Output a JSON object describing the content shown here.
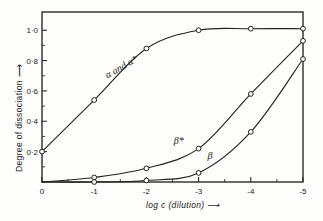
{
  "chart_data": {
    "type": "line",
    "title": "",
    "xlabel": "log c  (dilution)",
    "ylabel": "Degree of dissociation",
    "x": [
      0,
      -1,
      -2,
      -3,
      -4,
      -5
    ],
    "xtick_labels": [
      "0",
      "-1",
      "-2",
      "-3",
      "-4",
      "-5"
    ],
    "ytick_labels": [
      "0·2",
      "0·4",
      "0·6",
      "0·8",
      "1·0"
    ],
    "ytick_values": [
      0.2,
      0.4,
      0.6,
      0.8,
      1.0
    ],
    "xlim": [
      0,
      -5
    ],
    "ylim": [
      0,
      1.12
    ],
    "grid": false,
    "legend_position": "inline-annotations",
    "marker": "open-circle",
    "line_color": "#222222",
    "series": [
      {
        "name": "α and α*",
        "label": "α and α*",
        "values": [
          0.2,
          0.54,
          0.88,
          1.0,
          1.01,
          1.01
        ]
      },
      {
        "name": "β*",
        "label": "β*",
        "values": [
          0.0,
          0.03,
          0.09,
          0.22,
          0.58,
          0.93
        ]
      },
      {
        "name": "β",
        "label": "β",
        "values": [
          0.0,
          0.0,
          0.01,
          0.06,
          0.33,
          0.81
        ]
      }
    ],
    "annotations": [
      {
        "text": "α and α*",
        "x": -1.55,
        "y": 0.74,
        "rotation": -30
      },
      {
        "text": "β*",
        "x": -2.62,
        "y": 0.25,
        "rotation": 0
      },
      {
        "text": "β",
        "x": -3.22,
        "y": 0.15,
        "rotation": 0
      }
    ],
    "axis_arrows": {
      "x": "right",
      "y": "up"
    }
  },
  "figure": {
    "xlabel_text": "log c  (dilution)",
    "ylabel_text": "Degree of dissociation",
    "arrow_glyph": "⟶"
  }
}
